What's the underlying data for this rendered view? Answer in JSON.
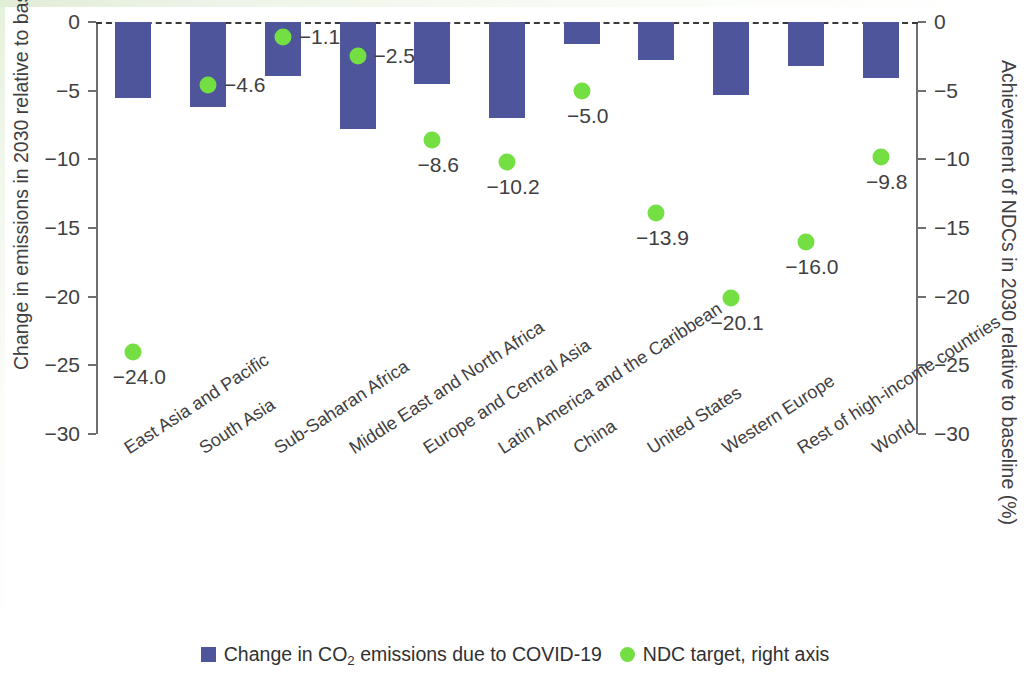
{
  "chart_data": {
    "type": "bar",
    "title": "",
    "subtitle": "",
    "xlabel": "",
    "ylabel": "Change in emissions in 2030 relative to baseline (%)",
    "y2label": "Achievement of NDCs in 2030 relative to baseline (%)",
    "ylim": [
      -30,
      0
    ],
    "y2lim": [
      -30,
      0
    ],
    "yticks": [
      "0",
      "−5",
      "−10",
      "−15",
      "−20",
      "−25",
      "−30"
    ],
    "ytick_values": [
      0,
      -5,
      -10,
      -15,
      -20,
      -25,
      -30
    ],
    "y2ticks": [
      "0",
      "−5",
      "−10",
      "−15",
      "−20",
      "−25",
      "−30"
    ],
    "y2tick_values": [
      0,
      -5,
      -10,
      -15,
      -20,
      -25,
      -30
    ],
    "grid": false,
    "zero_line": "dashed",
    "legend_position": "bottom",
    "categories": [
      "East Asia and Pacific",
      "South Asia",
      "Sub-Saharan Africa",
      "Middle East and North Africa",
      "Europe and Central Asia",
      "Latin America and the Caribbean",
      "China",
      "United States",
      "Western Europe",
      "Rest of high-income countries",
      "World"
    ],
    "series": [
      {
        "name": "Change in CO2 emissions due to COVID-19",
        "legend_label": "Change in CO₂ emissions due to COVID-19",
        "type": "bar",
        "axis": "left",
        "color": "#4f559b",
        "values": [
          -5.5,
          -6.2,
          -3.9,
          -7.8,
          -4.5,
          -7.0,
          -1.6,
          -2.8,
          -5.3,
          -3.2,
          -4.1
        ],
        "labels": [
          "",
          "",
          "",
          "",
          "",
          "",
          "",
          "",
          "",
          "",
          ""
        ]
      },
      {
        "name": "NDC target, right axis",
        "legend_label": "NDC target, right axis",
        "type": "scatter",
        "axis": "right",
        "color": "#73df43",
        "values": [
          -24.0,
          -4.6,
          -1.1,
          -2.5,
          -8.6,
          -10.2,
          -5.0,
          -13.9,
          -20.1,
          -16.0,
          -9.8
        ],
        "labels": [
          "−24.0",
          "−4.6",
          "−1.1",
          "−2.5",
          "−8.6",
          "−10.2",
          "−5.0",
          "−13.9",
          "−20.1",
          "−16.0",
          "−9.8"
        ],
        "label_positions": [
          "below",
          "right",
          "right",
          "right",
          "below",
          "below",
          "below",
          "below",
          "below",
          "below",
          "below"
        ]
      }
    ]
  },
  "legend": {
    "items": [
      {
        "icon": "square-swatch",
        "label_pre": "Change in CO",
        "label_sub": "2",
        "label_post": " emissions due to COVID-19"
      },
      {
        "icon": "circle-swatch",
        "label": "NDC target, right axis"
      }
    ]
  },
  "axes": {
    "left_title": "Change in emissions in 2030 relative to baseline (%)",
    "right_title": "Achievement of NDCs in 2030 relative to baseline (%)"
  },
  "colors": {
    "bar": "#4f559b",
    "dot": "#73df43",
    "axis": "#6f7072",
    "text": "#3f4042",
    "zero_line": "#3a3a3c",
    "background": "#ffffff"
  }
}
